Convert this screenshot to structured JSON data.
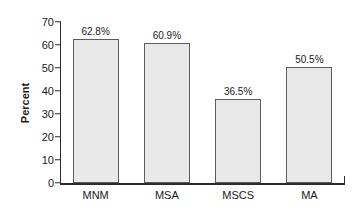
{
  "chart_data": {
    "type": "bar",
    "title": "",
    "xlabel": "",
    "ylabel": "Percent",
    "categories": [
      "MNM",
      "MSA",
      "MSCS",
      "MA"
    ],
    "values": [
      62.8,
      60.9,
      36.5,
      50.5
    ],
    "data_labels": [
      "62.8%",
      "60.9%",
      "36.5%",
      "50.5%"
    ],
    "ylim": [
      0,
      70
    ],
    "ytick_labels": [
      "0",
      "10",
      "20",
      "30",
      "40",
      "50",
      "60",
      "70"
    ],
    "ytick_values": [
      0,
      10,
      20,
      30,
      40,
      50,
      60,
      70
    ],
    "grid": false,
    "legend": null,
    "bar_fill_color": "#e9e9e9",
    "bar_border_color": "#5c5c5c",
    "axis_color": "#2b2b2b",
    "text_color": "#1a1a1a"
  }
}
